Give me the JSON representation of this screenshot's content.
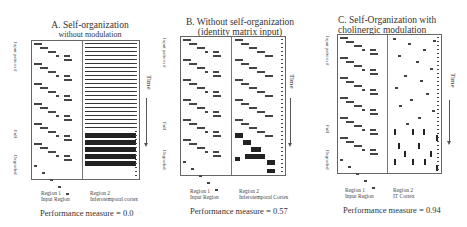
{
  "panels": [
    {
      "id": "A",
      "title_line1": "A. Self-organization",
      "title_line2": "without modulation",
      "y_axis_label": "Input pattern #",
      "y_full_label": "Full",
      "y_degraded_label": "Degraded",
      "region1_line1": "Region 1",
      "region1_line2": "Input Region",
      "region2_line1": "Region 2",
      "region2_line2": "Inferotemporal cortex",
      "time_label": "Time",
      "performance": "Performance measure = 0.0"
    },
    {
      "id": "B",
      "title_line1": "B. Without self-organization",
      "title_line2": "(identity matrix input)",
      "y_axis_label": "Input pattern #",
      "y_full_label": "Full",
      "y_degraded_label": "Degraded",
      "region1_line1": "Region 1",
      "region1_line2": "Input Region",
      "region2_line1": "Region 2",
      "region2_line2": "Inferotemporal Cortex",
      "time_label": "Time",
      "performance": "Performance measure = 0.57"
    },
    {
      "id": "C",
      "title_line1": "C. Self-Organization with",
      "title_line2": "cholinergic modulation",
      "y_axis_label": "Input pattern #",
      "y_full_label": "Full",
      "y_degraded_label": "Degraded",
      "region1_line1": "Region 1",
      "region1_line2": "Input Region",
      "region2_line1": "Region 2",
      "region2_line2": "IT Cortex",
      "time_label": "Time",
      "performance": "Performance measure = 0.94"
    }
  ]
}
